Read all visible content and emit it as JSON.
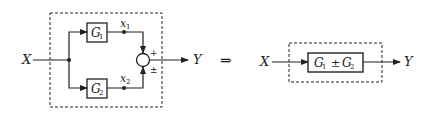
{
  "diagram": {
    "type": "block-diagram",
    "colors": {
      "stroke": "#222222",
      "background": "#ffffff"
    },
    "left": {
      "input_label": "X",
      "output_label": "Y",
      "blocks": [
        {
          "id": "G1",
          "name": "G",
          "sub": "1"
        },
        {
          "id": "G2",
          "name": "G",
          "sub": "2"
        }
      ],
      "signals": [
        {
          "name": "x",
          "sub": "1"
        },
        {
          "name": "x",
          "sub": "2"
        }
      ],
      "summing_junction": {
        "top_sign": "+",
        "bottom_sign": "±"
      }
    },
    "transform_symbol": "⇒",
    "right": {
      "input_label": "X",
      "output_label": "Y",
      "block": {
        "g1": "G",
        "g1_sub": "1",
        "op": "±",
        "g2": "G",
        "g2_sub": "2"
      }
    }
  }
}
